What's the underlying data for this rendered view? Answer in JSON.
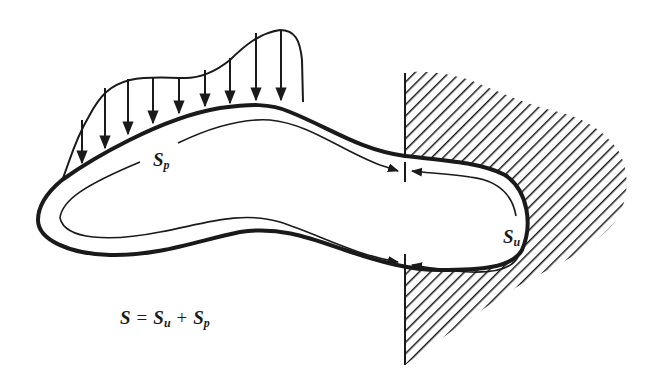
{
  "diagram": {
    "labels": {
      "sp": {
        "base": "S",
        "sub": "p"
      },
      "su": {
        "base": "S",
        "sub": "u"
      }
    },
    "formula": {
      "lhs": "S",
      "eq": "=",
      "term1": {
        "base": "S",
        "sub": "u"
      },
      "plus": "+",
      "term2": {
        "base": "S",
        "sub": "p"
      }
    },
    "elements": {
      "body_outline": "closed elongated body boundary",
      "traction_load": "distributed load arrows acting downward on upper boundary (S_p)",
      "fixed_support": "hatched rigid wall region gripping right end (S_u)",
      "boundary_markers": "two arrow-pair markers separating S_p and S_u"
    },
    "colors": {
      "ink": "#1a1a1a",
      "background": "#ffffff"
    }
  }
}
